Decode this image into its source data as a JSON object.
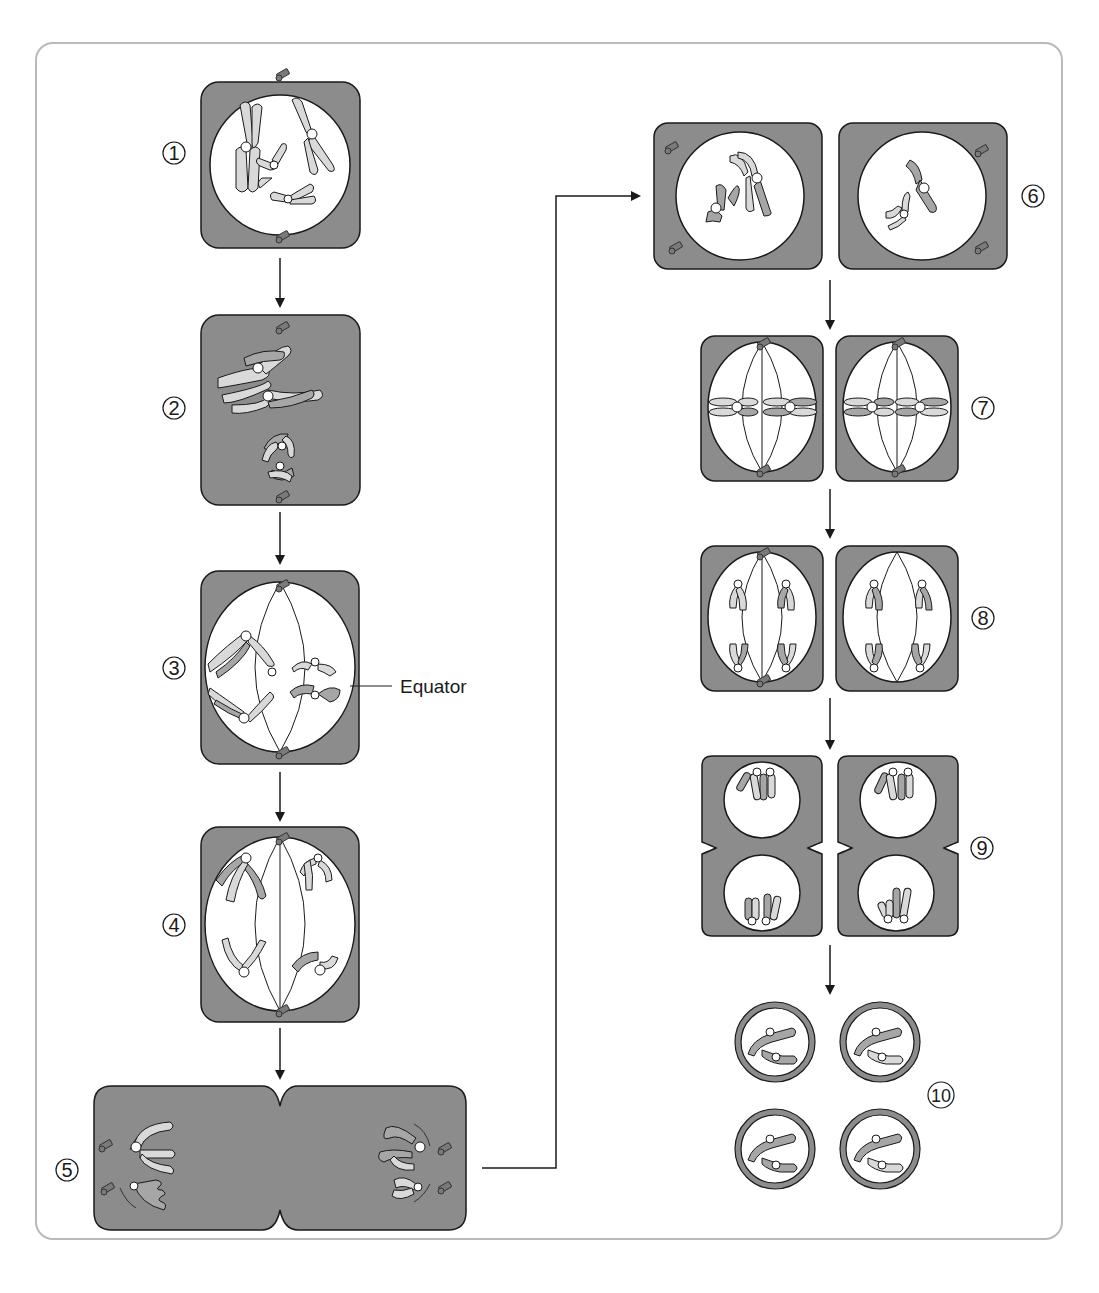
{
  "colors": {
    "cell_fill": "#8c8c8c",
    "cytoplasm_fill": "#ffffff",
    "chromosome_light": "#d9d9d9",
    "chromosome_dark": "#a6a6a6",
    "outline": "#1a1a1a",
    "frame_border": "#b9b9b9"
  },
  "stages": [
    {
      "number": "1",
      "symbol": "①",
      "description": "Prophase I (early) – chromosomes condense in nucleus"
    },
    {
      "number": "2",
      "symbol": "②",
      "description": "Prophase I (synapsis) – homologous chromosomes pair"
    },
    {
      "number": "3",
      "symbol": "③",
      "description": "Metaphase I – homologues align on equator"
    },
    {
      "number": "4",
      "symbol": "④",
      "description": "Anaphase I – homologues separate to poles"
    },
    {
      "number": "5",
      "symbol": "⑤",
      "description": "Telophase I / cytokinesis"
    },
    {
      "number": "6",
      "symbol": "⑥",
      "description": "Prophase II – two haploid cells"
    },
    {
      "number": "7",
      "symbol": "⑦",
      "description": "Metaphase II"
    },
    {
      "number": "8",
      "symbol": "⑧",
      "description": "Anaphase II"
    },
    {
      "number": "9",
      "symbol": "⑨",
      "description": "Telophase II / cytokinesis"
    },
    {
      "number": "10",
      "symbol": "⑩",
      "description": "Four haploid gametes"
    }
  ],
  "labels": {
    "equator": "Equator"
  }
}
